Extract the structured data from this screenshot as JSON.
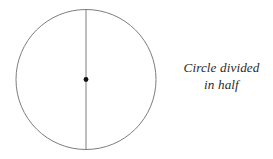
{
  "figure": {
    "title": "Circle divided in half",
    "background_color": "#ffffff",
    "width": 273,
    "height": 159
  },
  "caption": {
    "line1": "Circle divided",
    "line2": "in half",
    "full_text": "Circle divided in half",
    "color": "#2b2b2b",
    "style": "italic-serif",
    "align": "center"
  },
  "diagram": {
    "shape_name": "circle",
    "stroke_color": "#7d7d7d",
    "stroke_width": 1,
    "fill": "none",
    "center_x": 86,
    "center_y": 79.5,
    "radius": 70,
    "divider": {
      "name": "vertical-diameter",
      "x": 86,
      "y_top": 9.5,
      "y_bottom": 149.5,
      "stroke_color": "#7d7d7d",
      "stroke_width": 1
    },
    "center_point": {
      "name": "center-dot",
      "x": 86,
      "y": 79.5,
      "radius": 2.4,
      "color": "#111111"
    },
    "parts_count": 2
  }
}
